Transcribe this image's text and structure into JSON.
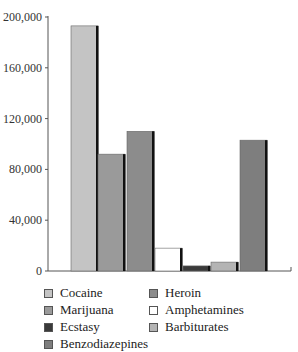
{
  "chart_data": {
    "type": "bar",
    "title": "",
    "xlabel": "",
    "ylabel": "",
    "ylim": [
      0,
      200000
    ],
    "yticks": [
      0,
      40000,
      80000,
      120000,
      160000,
      200000
    ],
    "ytick_labels": [
      "0",
      "40,000",
      "80,000",
      "120,000",
      "160,000",
      "200,000"
    ],
    "grid": false,
    "legend_position": "bottom",
    "categories": [
      "Cocaine",
      "Marijuana",
      "Heroin",
      "Amphetamines",
      "Ecstasy",
      "Barbiturates",
      "Benzodiazepines"
    ],
    "values": [
      193000,
      92000,
      110000,
      18000,
      4000,
      7000,
      103000
    ],
    "colors": [
      "#c4c4c4",
      "#9a9a9a",
      "#8c8c8c",
      "#ffffff",
      "#3a3a3a",
      "#b4b4b4",
      "#7e7e7e"
    ],
    "legend": [
      {
        "label": "Cocaine",
        "color": "#c4c4c4",
        "col": 0,
        "row": 0
      },
      {
        "label": "Heroin",
        "color": "#8c8c8c",
        "col": 1,
        "row": 0
      },
      {
        "label": "Marijuana",
        "color": "#9a9a9a",
        "col": 0,
        "row": 1
      },
      {
        "label": "Amphetamines",
        "color": "#ffffff",
        "col": 1,
        "row": 1
      },
      {
        "label": "Ecstasy",
        "color": "#3a3a3a",
        "col": 0,
        "row": 2
      },
      {
        "label": "Barbiturates",
        "color": "#b4b4b4",
        "col": 1,
        "row": 2
      },
      {
        "label": "Benzodiazepines",
        "color": "#7e7e7e",
        "col": 0,
        "row": 3
      }
    ]
  }
}
